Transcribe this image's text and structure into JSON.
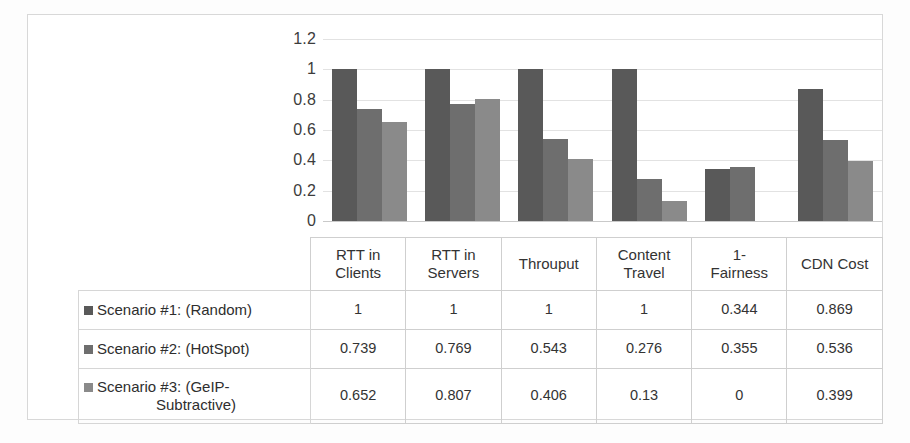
{
  "chart_data": {
    "type": "bar",
    "title": "",
    "xlabel": "",
    "ylabel": "",
    "ylim": [
      0,
      1.2
    ],
    "grid": true,
    "legend_position": "table-left-column",
    "categories": [
      "RTT in Clients",
      "RTT in Servers",
      "Throuput",
      "Content Travel",
      "1-Fairness",
      "CDN Cost"
    ],
    "y_ticks": [
      "0",
      "0.2",
      "0.4",
      "0.6",
      "0.8",
      "1",
      "1.2"
    ],
    "series": [
      {
        "name": "Scenario #1: (Random)",
        "color": "#595959",
        "values": [
          1,
          1,
          1,
          1,
          0.344,
          0.869
        ],
        "labels": [
          "1",
          "1",
          "1",
          "1",
          "0.344",
          "0.869"
        ]
      },
      {
        "name": "Scenario #2: (HotSpot)",
        "color": "#6e6e6e",
        "values": [
          0.739,
          0.769,
          0.543,
          0.276,
          0.355,
          0.536
        ],
        "labels": [
          "0.739",
          "0.769",
          "0.543",
          "0.276",
          "0.355",
          "0.536"
        ]
      },
      {
        "name": "Scenario #3: (GeIP-Subtractive)",
        "name_line1": "Scenario #3: (GeIP-",
        "name_line2": "Subtractive)",
        "color": "#8a8a8a",
        "values": [
          0.652,
          0.807,
          0.406,
          0.13,
          0,
          0.399
        ],
        "labels": [
          "0.652",
          "0.807",
          "0.406",
          "0.13",
          "0",
          "0.399"
        ]
      }
    ]
  },
  "table": {
    "header_cells": [
      {
        "line1": "RTT in",
        "line2": "Clients"
      },
      {
        "line1": "RTT in",
        "line2": "Servers"
      },
      {
        "line1": "Throuput",
        "line2": ""
      },
      {
        "line1": "Content",
        "line2": "Travel"
      },
      {
        "line1": "1-",
        "line2": "Fairness"
      },
      {
        "line1": "CDN Cost",
        "line2": ""
      }
    ]
  },
  "colors": {
    "series1": "#595959",
    "series2": "#6e6e6e",
    "series3": "#8a8a8a",
    "gridline": "#e2e2e2",
    "border": "#cfcfcf",
    "outer_frame": "#d8d8d8",
    "text": "#333333"
  }
}
